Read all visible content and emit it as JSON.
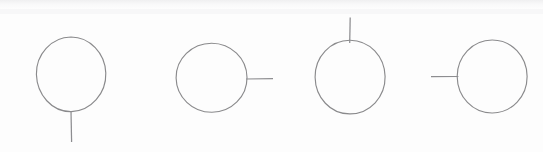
{
  "figure": {
    "title": "Circle with attached line segment, four orientations",
    "background_color": "#fdfdfd",
    "stroke_color": "#8a8a8c",
    "stroke_width": 1.15,
    "canvas": {
      "width": 543,
      "height": 152
    },
    "shape_count": 4,
    "shapes": [
      {
        "id": "shape-1",
        "name": "circle-with-bottom-line",
        "index": 1,
        "tail_position": "bottom",
        "tail_direction": "down",
        "circle": {
          "cx": 71,
          "cy": 74.5,
          "rx": 34.5,
          "ry": 37.5,
          "rotation": -4
        },
        "tail": {
          "x1": 71,
          "y1": 111,
          "x2": 71.5,
          "y2": 142
        }
      },
      {
        "id": "shape-2",
        "name": "circle-with-right-line",
        "index": 2,
        "tail_position": "right",
        "tail_direction": "right",
        "circle": {
          "cx": 211.5,
          "cy": 77.5,
          "rx": 35.5,
          "ry": 34.5,
          "rotation": 2
        },
        "tail": {
          "x1": 246,
          "y1": 79,
          "x2": 273,
          "y2": 78.5
        }
      },
      {
        "id": "shape-3",
        "name": "circle-with-top-line",
        "index": 3,
        "tail_position": "top",
        "tail_direction": "up",
        "circle": {
          "cx": 350,
          "cy": 77,
          "rx": 35,
          "ry": 37,
          "rotation": 3
        },
        "tail": {
          "x1": 350,
          "y1": 17.5,
          "x2": 349.5,
          "y2": 43
        }
      },
      {
        "id": "shape-4",
        "name": "circle-with-left-line",
        "index": 4,
        "tail_position": "left",
        "tail_direction": "left",
        "circle": {
          "cx": 492,
          "cy": 76.5,
          "rx": 35,
          "ry": 36.5,
          "rotation": -2
        },
        "tail": {
          "x1": 431,
          "y1": 76.5,
          "x2": 458,
          "y2": 76.5
        }
      }
    ]
  }
}
